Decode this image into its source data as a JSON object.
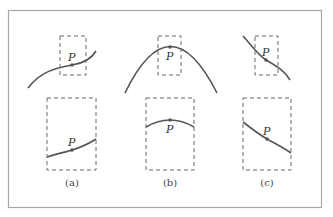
{
  "figure": {
    "point_label": "P",
    "panels": [
      {
        "id": "a",
        "caption": "(a)",
        "description": "curve increasing through P; zoomed view appears nearly straight rising line"
      },
      {
        "id": "b",
        "caption": "(b)",
        "description": "parabola with maximum at P; zoomed view shows flattened arc"
      },
      {
        "id": "c",
        "caption": "(c)",
        "description": "curve decreasing through P; zoomed view appears nearly straight falling line"
      }
    ]
  },
  "colors": {
    "frame": "#a8a8a8",
    "curve": "#555555",
    "dashed_box": "#6a6a6a"
  }
}
